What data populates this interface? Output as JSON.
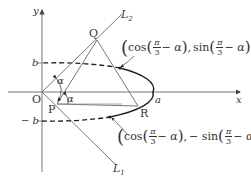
{
  "diagram": {
    "axes": {
      "x_label": "x",
      "y_label": "y",
      "origin_label": "O"
    },
    "ticks": {
      "b_label": "b",
      "neg_b_label": "− b",
      "a_label": "a"
    },
    "points": {
      "P": "P",
      "Q": "Q",
      "R": "R"
    },
    "lines": {
      "L1": "L",
      "L1_sub": "1",
      "L2": "L",
      "L2_sub": "2"
    },
    "angles": {
      "alpha_upper": "α",
      "alpha_lower": "α"
    },
    "annotations": {
      "upper": {
        "open": "(",
        "fn1": "cos",
        "frac_num": "π",
        "frac_den": "3",
        "minus_alpha": "− α",
        "sep": ",",
        "fn2": "sin",
        "close": ")"
      },
      "lower": {
        "open": "(",
        "fn1": "cos",
        "frac_num": "π",
        "frac_den": "3",
        "minus_alpha": "− α",
        "sep": ",",
        "fn2": "− sin",
        "close": ")"
      }
    },
    "colors": {
      "stroke": "#555555",
      "curve": "#222222",
      "text": "#333333"
    }
  }
}
